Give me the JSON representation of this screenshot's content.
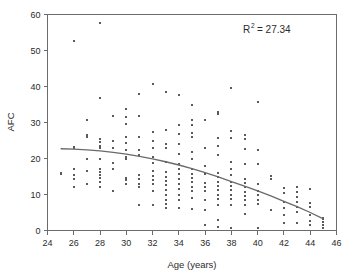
{
  "chart_data": {
    "type": "scatter",
    "title": "",
    "xlabel": "Age (years)",
    "ylabel": "AFC",
    "xlim": [
      24,
      46
    ],
    "ylim": [
      0,
      60
    ],
    "xticks": [
      24,
      26,
      28,
      30,
      32,
      34,
      36,
      38,
      40,
      42,
      44,
      46
    ],
    "yticks": [
      0,
      10,
      20,
      30,
      40,
      50,
      60
    ],
    "grid": false,
    "legend": null,
    "annotations": [
      {
        "name": "r-squared",
        "text": "R2 = 27.34",
        "label": "R",
        "superscript": "2",
        "value_text": "= 27.34",
        "value": 27.34,
        "position": "top-right"
      }
    ],
    "marker_color": "#5a5a5a",
    "marker_size": 2,
    "marker_shape": "square",
    "fit": {
      "name": "quadratic-trend",
      "type": "curve",
      "color": "#6a6a6a",
      "x_start": 25,
      "x_end": 45,
      "points": [
        [
          25,
          22.7
        ],
        [
          26,
          22.6
        ],
        [
          27,
          22.4
        ],
        [
          28,
          22.1
        ],
        [
          29,
          21.7
        ],
        [
          30,
          21.2
        ],
        [
          31,
          20.6
        ],
        [
          32,
          19.9
        ],
        [
          33,
          19.1
        ],
        [
          34,
          18.2
        ],
        [
          35,
          17.2
        ],
        [
          36,
          16.1
        ],
        [
          37,
          14.9
        ],
        [
          38,
          13.6
        ],
        [
          39,
          12.3
        ],
        [
          40,
          11.0
        ],
        [
          41,
          9.6
        ],
        [
          42,
          8.1
        ],
        [
          43,
          6.6
        ],
        [
          44,
          5.0
        ],
        [
          45,
          3.2
        ]
      ]
    },
    "points": [
      [
        25,
        16.0
      ],
      [
        25,
        15.8
      ],
      [
        26,
        52.7
      ],
      [
        26,
        23.2
      ],
      [
        26,
        22.9
      ],
      [
        26,
        17.0
      ],
      [
        26,
        15.3
      ],
      [
        26,
        14.4
      ],
      [
        26,
        12.0
      ],
      [
        27,
        30.8
      ],
      [
        27,
        26.5
      ],
      [
        27,
        25.9
      ],
      [
        27,
        19.8
      ],
      [
        27,
        16.5
      ],
      [
        27,
        12.8
      ],
      [
        28,
        57.6
      ],
      [
        28,
        36.8
      ],
      [
        28,
        25.3
      ],
      [
        28,
        24.5
      ],
      [
        28,
        23.6
      ],
      [
        28,
        22.8
      ],
      [
        28,
        19.9
      ],
      [
        28,
        17.2
      ],
      [
        28,
        16.3
      ],
      [
        28,
        15.4
      ],
      [
        28,
        14.5
      ],
      [
        28,
        13.6
      ],
      [
        28,
        12.0
      ],
      [
        29,
        31.7
      ],
      [
        29,
        24.8
      ],
      [
        29,
        22.9
      ],
      [
        29,
        18.8
      ],
      [
        29,
        17.0
      ],
      [
        29,
        11.0
      ],
      [
        30,
        33.8
      ],
      [
        30,
        31.6
      ],
      [
        30,
        29.7
      ],
      [
        30,
        26.0
      ],
      [
        30,
        24.2
      ],
      [
        30,
        22.4
      ],
      [
        30,
        20.5
      ],
      [
        30,
        20.2
      ],
      [
        30,
        19.8
      ],
      [
        30,
        14.6
      ],
      [
        30,
        14.1
      ],
      [
        30,
        13.0
      ],
      [
        31,
        37.8
      ],
      [
        31,
        31.7
      ],
      [
        31,
        26.0
      ],
      [
        31,
        22.3
      ],
      [
        31,
        21.0
      ],
      [
        31,
        15.3
      ],
      [
        31,
        14.2
      ],
      [
        31,
        13.0
      ],
      [
        31,
        12.0
      ],
      [
        31,
        7.0
      ],
      [
        32,
        40.6
      ],
      [
        32,
        27.5
      ],
      [
        32,
        25.0
      ],
      [
        32,
        22.8
      ],
      [
        32,
        20.5
      ],
      [
        32,
        18.8
      ],
      [
        32,
        16.4
      ],
      [
        32,
        15.2
      ],
      [
        32,
        14.0
      ],
      [
        32,
        12.8
      ],
      [
        32,
        11.0
      ],
      [
        32,
        7.2
      ],
      [
        33,
        38.6
      ],
      [
        33,
        27.8
      ],
      [
        33,
        23.9
      ],
      [
        33,
        23.0
      ],
      [
        33,
        19.0
      ],
      [
        33,
        18.9
      ],
      [
        33,
        16.2
      ],
      [
        33,
        15.0
      ],
      [
        33,
        13.8
      ],
      [
        33,
        12.6
      ],
      [
        33,
        11.2
      ],
      [
        33,
        9.8
      ],
      [
        33,
        8.6
      ],
      [
        33,
        7.4
      ],
      [
        33,
        6.2
      ],
      [
        34,
        37.7
      ],
      [
        34,
        29.3
      ],
      [
        34,
        26.8
      ],
      [
        34,
        24.0
      ],
      [
        34,
        21.2
      ],
      [
        34,
        18.4
      ],
      [
        34,
        17.0
      ],
      [
        34,
        15.6
      ],
      [
        34,
        14.2
      ],
      [
        34,
        12.8
      ],
      [
        34,
        11.4
      ],
      [
        34,
        10.0
      ],
      [
        34,
        8.6
      ],
      [
        34,
        6.2
      ],
      [
        35,
        34.8
      ],
      [
        35,
        30.6
      ],
      [
        35,
        29.4
      ],
      [
        35,
        27.0
      ],
      [
        35,
        26.0
      ],
      [
        35,
        21.7
      ],
      [
        35,
        19.8
      ],
      [
        35,
        17.2
      ],
      [
        35,
        15.8
      ],
      [
        35,
        14.6
      ],
      [
        35,
        13.4
      ],
      [
        35,
        12.2
      ],
      [
        35,
        11.0
      ],
      [
        35,
        9.0
      ],
      [
        35,
        6.0
      ],
      [
        36,
        30.6
      ],
      [
        36,
        22.8
      ],
      [
        36,
        17.9
      ],
      [
        36,
        15.6
      ],
      [
        36,
        13.3
      ],
      [
        36,
        12.2
      ],
      [
        36,
        11.0
      ],
      [
        36,
        8.6
      ],
      [
        36,
        5.8
      ],
      [
        36,
        1.6
      ],
      [
        37,
        33.0
      ],
      [
        37,
        32.3
      ],
      [
        37,
        25.7
      ],
      [
        37,
        23.6
      ],
      [
        37,
        20.9
      ],
      [
        37,
        16.0
      ],
      [
        37,
        14.8
      ],
      [
        37,
        13.6
      ],
      [
        37,
        12.4
      ],
      [
        37,
        11.2
      ],
      [
        37,
        10.0
      ],
      [
        37,
        8.8
      ],
      [
        37,
        7.0
      ],
      [
        37,
        3.0
      ],
      [
        37,
        0.9
      ],
      [
        38,
        39.5
      ],
      [
        38,
        27.7
      ],
      [
        38,
        25.6
      ],
      [
        38,
        19.0
      ],
      [
        38,
        17.2
      ],
      [
        38,
        15.4
      ],
      [
        38,
        13.6
      ],
      [
        38,
        12.4
      ],
      [
        38,
        11.2
      ],
      [
        38,
        10.0
      ],
      [
        38,
        8.8
      ],
      [
        38,
        7.0
      ],
      [
        38,
        0.8
      ],
      [
        39,
        26.6
      ],
      [
        39,
        25.4
      ],
      [
        39,
        22.6
      ],
      [
        39,
        18.6
      ],
      [
        39,
        14.4
      ],
      [
        39,
        13.2
      ],
      [
        39,
        12.0
      ],
      [
        39,
        10.8
      ],
      [
        39,
        9.6
      ],
      [
        39,
        8.4
      ],
      [
        39,
        7.2
      ],
      [
        39,
        4.6
      ],
      [
        40,
        35.6
      ],
      [
        40,
        22.4
      ],
      [
        40,
        18.6
      ],
      [
        40,
        13.0
      ],
      [
        40,
        11.0
      ],
      [
        40,
        9.8
      ],
      [
        40,
        8.6
      ],
      [
        40,
        7.4
      ],
      [
        40,
        0.8
      ],
      [
        41,
        15.1
      ],
      [
        41,
        14.2
      ],
      [
        41,
        5.8
      ],
      [
        42,
        11.8
      ],
      [
        42,
        10.4
      ],
      [
        42,
        8.0
      ],
      [
        42,
        7.8
      ],
      [
        42,
        6.2
      ],
      [
        42,
        4.4
      ],
      [
        42,
        2.2
      ],
      [
        43,
        12.0
      ],
      [
        43,
        10.8
      ],
      [
        43,
        9.4
      ],
      [
        43,
        8.0
      ],
      [
        43,
        6.6
      ],
      [
        43,
        5.2
      ],
      [
        43,
        2.2
      ],
      [
        44,
        11.5
      ],
      [
        44,
        7.6
      ],
      [
        44,
        6.4
      ],
      [
        44,
        4.2
      ],
      [
        44,
        2.6
      ],
      [
        44,
        1.6
      ],
      [
        45,
        3.6
      ],
      [
        45,
        3.2
      ],
      [
        45,
        2.4
      ],
      [
        45,
        1.4
      ],
      [
        45,
        0.6
      ]
    ]
  },
  "axes": {
    "x_title": "Age (years)",
    "y_title": "AFC",
    "x_tick_labels": [
      "24",
      "26",
      "28",
      "30",
      "32",
      "34",
      "36",
      "38",
      "40",
      "42",
      "44",
      "46"
    ],
    "y_tick_labels": [
      "0",
      "10",
      "20",
      "30",
      "40",
      "50",
      "60"
    ]
  },
  "colors": {
    "marker": "#5a5a5a",
    "fit_line": "#6a6a6a",
    "axis": "#6b6b6b",
    "text": "#2b2b2b",
    "background": "#ffffff"
  }
}
